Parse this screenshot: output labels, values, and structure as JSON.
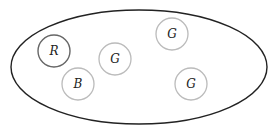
{
  "diagram": {
    "container": {
      "shape": "ellipse",
      "cx": 139,
      "cy": 67,
      "rx": 128,
      "ry": 57,
      "stroke": "#222222"
    },
    "nodes": [
      {
        "id": "r",
        "label": "R",
        "cx": 54,
        "cy": 51,
        "r": 16,
        "stroke": "#666666"
      },
      {
        "id": "g1",
        "label": "G",
        "cx": 115,
        "cy": 59,
        "r": 16,
        "stroke": "#bbbbbb"
      },
      {
        "id": "g2",
        "label": "G",
        "cx": 172,
        "cy": 34,
        "r": 16,
        "stroke": "#bbbbbb"
      },
      {
        "id": "b",
        "label": "B",
        "cx": 78,
        "cy": 84,
        "r": 16,
        "stroke": "#bbbbbb"
      },
      {
        "id": "g3",
        "label": "G",
        "cx": 191,
        "cy": 84,
        "r": 16,
        "stroke": "#bbbbbb"
      }
    ]
  }
}
